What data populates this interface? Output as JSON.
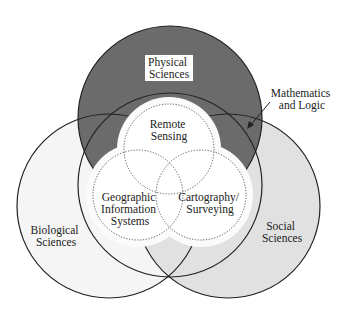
{
  "diagram": {
    "type": "venn",
    "colors": {
      "physical_fill": "#6b6b6b",
      "biological_fill": "#f5f5f5",
      "social_fill": "#e1e1e1",
      "inner_fill": "#ffffff",
      "halo_fill": "#fbfbfb",
      "outline": "#222222",
      "dotted": "#555555"
    },
    "outer_sets": [
      {
        "id": "physical",
        "label_lines": [
          "Physical",
          "Sciences"
        ]
      },
      {
        "id": "biological",
        "label_lines": [
          "Biological",
          "Sciences"
        ]
      },
      {
        "id": "social",
        "label_lines": [
          "Social",
          "Sciences"
        ]
      }
    ],
    "middle_set": {
      "id": "math",
      "label_lines": [
        "Mathematics",
        "and Logic"
      ]
    },
    "inner_sets": [
      {
        "id": "remote",
        "label_lines": [
          "Remote",
          "Sensing"
        ]
      },
      {
        "id": "gis",
        "label_lines": [
          "Geographic",
          "Information",
          "Systems"
        ]
      },
      {
        "id": "carto",
        "label_lines": [
          "Cartography/",
          "Surveying"
        ]
      }
    ]
  }
}
